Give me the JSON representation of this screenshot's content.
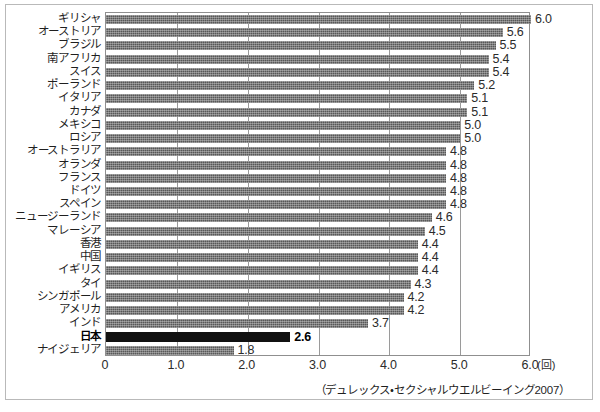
{
  "chart_data": {
    "type": "bar",
    "orientation": "horizontal",
    "title": "",
    "subtitle": "",
    "xlabel": "",
    "ylabel": "",
    "unit_label": "(回)",
    "xlim": [
      0,
      6.0
    ],
    "xticks": [
      "0",
      "1.0",
      "2.0",
      "3.0",
      "4.0",
      "5.0",
      "6.0"
    ],
    "xtick_values": [
      0,
      1.0,
      2.0,
      3.0,
      4.0,
      5.0,
      6.0
    ],
    "grid": true,
    "grid_axis": "x",
    "legend": "none",
    "source_note": "（デュレックス・セクシャルウエルビーイング2007）",
    "highlight_category": "日本",
    "colors": {
      "bar": "#585858",
      "bar_highlight": "#111111",
      "grid": "#9a9a9a",
      "axis": "#8f8f8f",
      "text": "#1f1f1f",
      "background": "#ffffff"
    },
    "categories": [
      "ギリシャ",
      "オーストリア",
      "ブラジル",
      "南アフリカ",
      "スイス",
      "ポーランド",
      "イタリア",
      "カナダ",
      "メキシコ",
      "ロシア",
      "オーストラリア",
      "オランダ",
      "フランス",
      "ドイツ",
      "スペイン",
      "ニュージーランド",
      "マレーシア",
      "香港",
      "中国",
      "イギリス",
      "タイ",
      "シンガポール",
      "アメリカ",
      "インド",
      "日本",
      "ナイジェリア"
    ],
    "values": [
      6.0,
      5.6,
      5.5,
      5.4,
      5.4,
      5.2,
      5.1,
      5.1,
      5.0,
      5.0,
      4.8,
      4.8,
      4.8,
      4.8,
      4.8,
      4.6,
      4.5,
      4.4,
      4.4,
      4.4,
      4.3,
      4.2,
      4.2,
      3.7,
      2.6,
      1.8
    ],
    "value_labels": [
      "6.0",
      "5.6",
      "5.5",
      "5.4",
      "5.4",
      "5.2",
      "5.1",
      "5.1",
      "5.0",
      "5.0",
      "4.8",
      "4.8",
      "4.8",
      "4.8",
      "4.8",
      "4.6",
      "4.5",
      "4.4",
      "4.4",
      "4.4",
      "4.3",
      "4.2",
      "4.2",
      "3.7",
      "2.6",
      "1.8"
    ]
  }
}
